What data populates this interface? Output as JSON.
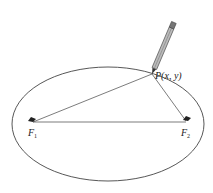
{
  "diagram": {
    "point_label": "P(x, y)",
    "focus1": {
      "label": "F",
      "subscript": "1"
    },
    "focus2": {
      "label": "F",
      "subscript": "2"
    },
    "colors": {
      "stroke": "#333333",
      "pencil": "#555555",
      "background": "#ffffff"
    }
  }
}
